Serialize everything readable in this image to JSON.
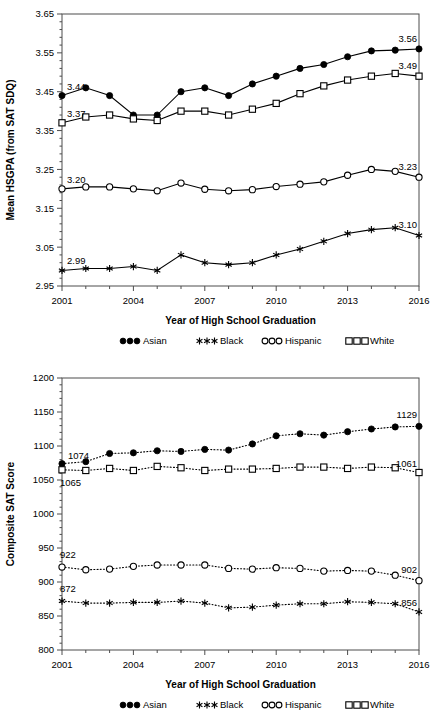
{
  "chart_data": [
    {
      "id": "hsgpa",
      "type": "line",
      "title": "",
      "xlabel": "Year of High School Graduation",
      "ylabel": "Mean HSGPA (from SAT SDQ)",
      "xlim": [
        2001,
        2016
      ],
      "ylim": [
        2.95,
        3.65
      ],
      "yticks": [
        "2.95",
        "3.05",
        "3.15",
        "3.25",
        "3.35",
        "3.45",
        "3.55",
        "3.65"
      ],
      "ytick_values": [
        2.95,
        3.05,
        3.15,
        3.25,
        3.35,
        3.45,
        3.55,
        3.65
      ],
      "xticks": [
        "2001",
        "2004",
        "2007",
        "2010",
        "2013",
        "2016"
      ],
      "xtick_values": [
        2001,
        2004,
        2007,
        2010,
        2013,
        2016
      ],
      "x": [
        2001,
        2002,
        2003,
        2004,
        2005,
        2006,
        2007,
        2008,
        2009,
        2010,
        2011,
        2012,
        2013,
        2014,
        2015,
        2016
      ],
      "grid": false,
      "line_style": "solid",
      "legend_position": "below",
      "series": [
        {
          "name": "Asian",
          "marker": "filled-circle",
          "values": [
            3.44,
            3.46,
            3.44,
            3.39,
            3.39,
            3.45,
            3.46,
            3.44,
            3.47,
            3.49,
            3.51,
            3.52,
            3.54,
            3.555,
            3.557,
            3.56
          ],
          "labels": [
            {
              "x": 2001,
              "text": "3.44",
              "anchor": "start",
              "dx": 5,
              "dy": -6
            },
            {
              "x": 2016,
              "text": "3.56",
              "anchor": "end",
              "dx": -2,
              "dy": -7
            }
          ]
        },
        {
          "name": "Black",
          "marker": "star",
          "values": [
            2.99,
            2.995,
            2.995,
            3.0,
            2.99,
            3.03,
            3.01,
            3.005,
            3.01,
            3.03,
            3.045,
            3.065,
            3.085,
            3.095,
            3.1,
            3.08
          ],
          "labels": [
            {
              "x": 2001,
              "text": "2.99",
              "anchor": "start",
              "dx": 5,
              "dy": -6
            },
            {
              "x": 2016,
              "text": "3.10",
              "anchor": "end",
              "dx": -2,
              "dy": -7
            }
          ]
        },
        {
          "name": "Hispanic",
          "marker": "open-circle",
          "values": [
            3.2,
            3.205,
            3.205,
            3.2,
            3.195,
            3.215,
            3.199,
            3.195,
            3.198,
            3.206,
            3.212,
            3.218,
            3.235,
            3.25,
            3.245,
            3.23
          ],
          "labels": [
            {
              "x": 2001,
              "text": "3.20",
              "anchor": "start",
              "dx": 5,
              "dy": -6
            },
            {
              "x": 2016,
              "text": "3.23",
              "anchor": "end",
              "dx": -2,
              "dy": -7
            }
          ]
        },
        {
          "name": "White",
          "marker": "open-square",
          "values": [
            3.37,
            3.385,
            3.39,
            3.38,
            3.376,
            3.4,
            3.4,
            3.39,
            3.405,
            3.42,
            3.445,
            3.465,
            3.48,
            3.49,
            3.497,
            3.49
          ],
          "labels": [
            {
              "x": 2001,
              "text": "3.37",
              "anchor": "start",
              "dx": 5,
              "dy": -6
            },
            {
              "x": 2016,
              "text": "3.49",
              "anchor": "end",
              "dx": -2,
              "dy": -7
            }
          ]
        }
      ],
      "legend": [
        {
          "label": "Asian",
          "marker": "filled-circle"
        },
        {
          "label": "Black",
          "marker": "star"
        },
        {
          "label": "Hispanic",
          "marker": "open-circle"
        },
        {
          "label": "White",
          "marker": "open-square"
        }
      ]
    },
    {
      "id": "sat",
      "type": "line",
      "title": "",
      "xlabel": "Year of High School Graduation",
      "ylabel": "Composite SAT Score",
      "xlim": [
        2001,
        2016
      ],
      "ylim": [
        800,
        1200
      ],
      "yticks": [
        "800",
        "850",
        "900",
        "950",
        "1000",
        "1050",
        "1100",
        "1150",
        "1200"
      ],
      "ytick_values": [
        800,
        850,
        900,
        950,
        1000,
        1050,
        1100,
        1150,
        1200
      ],
      "xticks": [
        "2001",
        "2004",
        "2007",
        "2010",
        "2013",
        "2016"
      ],
      "xtick_values": [
        2001,
        2004,
        2007,
        2010,
        2013,
        2016
      ],
      "x": [
        2001,
        2002,
        2003,
        2004,
        2005,
        2006,
        2007,
        2008,
        2009,
        2010,
        2011,
        2012,
        2013,
        2014,
        2015,
        2016
      ],
      "grid": false,
      "line_style": "dotted",
      "legend_position": "below",
      "series": [
        {
          "name": "Asian",
          "marker": "filled-circle",
          "values": [
            1074,
            1077,
            1089,
            1090,
            1093,
            1092,
            1095,
            1094,
            1103,
            1115,
            1118,
            1116,
            1121,
            1125,
            1128,
            1129
          ],
          "labels": [
            {
              "x": 2001,
              "text": "1074",
              "anchor": "start",
              "dx": 6,
              "dy": -5
            },
            {
              "x": 2016,
              "text": "1129",
              "anchor": "end",
              "dx": -2,
              "dy": -8
            }
          ]
        },
        {
          "name": "Black",
          "marker": "star",
          "values": [
            872,
            869,
            869,
            870,
            870,
            872,
            869,
            862,
            863,
            866,
            868,
            868,
            871,
            870,
            868,
            856
          ],
          "labels": [
            {
              "x": 2001,
              "text": "872",
              "anchor": "start",
              "dx": -2,
              "dy": -9
            },
            {
              "x": 2016,
              "text": "856",
              "anchor": "end",
              "dx": -2,
              "dy": -6
            }
          ]
        },
        {
          "name": "Hispanic",
          "marker": "open-circle",
          "values": [
            922,
            918,
            919,
            923,
            925,
            925,
            925,
            920,
            919,
            921,
            920,
            916,
            917,
            916,
            910,
            902
          ],
          "labels": [
            {
              "x": 2001,
              "text": "922",
              "anchor": "start",
              "dx": -2,
              "dy": -9
            },
            {
              "x": 2016,
              "text": "902",
              "anchor": "end",
              "dx": -2,
              "dy": -8
            }
          ]
        },
        {
          "name": "White",
          "marker": "open-square",
          "values": [
            1065,
            1064,
            1067,
            1064,
            1070,
            1068,
            1064,
            1066,
            1066,
            1067,
            1069,
            1069,
            1067,
            1069,
            1068,
            1061
          ],
          "labels": [
            {
              "x": 2001,
              "text": "1065",
              "anchor": "start",
              "dx": -2,
              "dy": 16
            },
            {
              "x": 2016,
              "text": "1061",
              "anchor": "end",
              "dx": -2,
              "dy": -6
            }
          ]
        }
      ],
      "legend": [
        {
          "label": "Asian",
          "marker": "filled-circle"
        },
        {
          "label": "Black",
          "marker": "star"
        },
        {
          "label": "Hispanic",
          "marker": "open-circle"
        },
        {
          "label": "White",
          "marker": "open-square"
        }
      ]
    }
  ],
  "colors": {
    "line": "#000000",
    "frame": "#4d4d4d",
    "background": "#ffffff",
    "text": "#000000"
  }
}
